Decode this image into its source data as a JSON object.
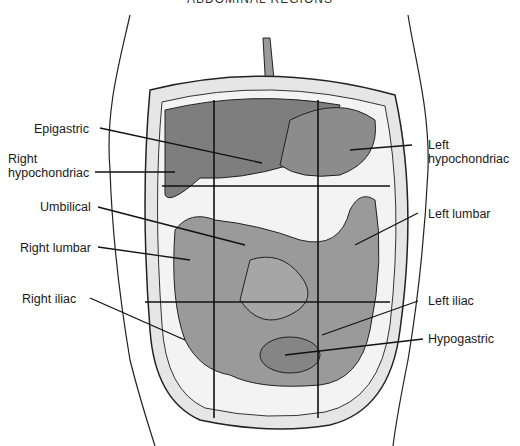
{
  "title": "ABDOMINAL REGIONS",
  "labels": {
    "epigastric": "Epigastric",
    "right_hypochondriac_1": "Right",
    "right_hypochondriac_2": "hypochondriac",
    "umbilical": "Umbilical",
    "right_lumbar": "Right lumbar",
    "right_iliac": "Right iliac",
    "left_hypochondriac_1": "Left",
    "left_hypochondriac_2": "hypochondriac",
    "left_lumbar": "Left lumbar",
    "left_iliac": "Left iliac",
    "hypogastric": "Hypogastric"
  },
  "colors": {
    "organ_fill": "#8a8a8a",
    "organ_dark": "#5e5e5e",
    "line": "#111111",
    "wall": "#cfcfcf"
  }
}
